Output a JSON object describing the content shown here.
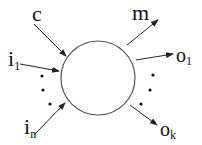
{
  "diagram": {
    "node": {
      "shape": "circle",
      "label": ""
    },
    "inputs": {
      "c": "c",
      "i1": {
        "base": "i",
        "sub": "1"
      },
      "in": {
        "base": "i",
        "sub": "n"
      }
    },
    "outputs": {
      "m": "m",
      "o1": {
        "base": "o",
        "sub": "1"
      },
      "ok": {
        "base": "o",
        "sub": "k"
      }
    },
    "colors": {
      "stroke": "#333333",
      "text": "#111111"
    }
  }
}
